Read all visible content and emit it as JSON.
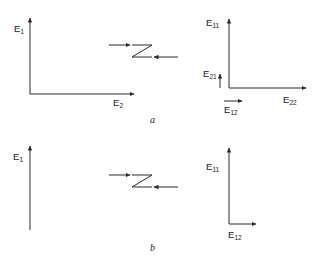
{
  "figure": {
    "stroke_color": "#2b2b2b",
    "background_color": "#ffffff"
  },
  "panels": [
    {
      "id": "a",
      "letter": "a",
      "left_axes": {
        "name": "incident-field-axes",
        "vertical": {
          "label": "E",
          "sub": "1",
          "arrow": "up"
        },
        "horizontal": {
          "label": "E",
          "sub": "2",
          "arrow": "right"
        }
      },
      "network": {
        "symbol": "Z",
        "in_arrow": {
          "direction": "right",
          "position": "top-left"
        },
        "out_arrow": {
          "direction": "left",
          "position": "bottom-right"
        }
      },
      "right_axes": {
        "name": "scattered-field-axes",
        "vertical": {
          "label": "E",
          "sub": "11",
          "arrow": "up"
        },
        "horizontal": {
          "label": "E",
          "sub": "22",
          "arrow": "right"
        },
        "minor_vertical": {
          "label": "E",
          "sub": "21",
          "arrow": "up"
        },
        "minor_horizontal": {
          "label": "E",
          "sub": "12",
          "arrow": "right"
        }
      }
    },
    {
      "id": "b",
      "letter": "b",
      "left_axes": {
        "name": "incident-field-axes",
        "vertical": {
          "label": "E",
          "sub": "1",
          "arrow": "up"
        },
        "horizontal": null
      },
      "network": {
        "symbol": "Z",
        "in_arrow": {
          "direction": "right",
          "position": "top-left"
        },
        "out_arrow": {
          "direction": "right",
          "position": "bottom-right"
        }
      },
      "right_axes": {
        "name": "scattered-field-axes",
        "vertical": {
          "label": "E",
          "sub": "11",
          "arrow": "up"
        },
        "horizontal": {
          "label": "E",
          "sub": "12",
          "arrow": "right"
        }
      }
    }
  ],
  "labels": {
    "a_E1": "E",
    "a_E1_sub": "1",
    "a_E2": "E",
    "a_E2_sub": "2",
    "a_E11": "E",
    "a_E11_sub": "11",
    "a_E22": "E",
    "a_E22_sub": "22",
    "a_E21": "E",
    "a_E21_sub": "21",
    "a_E12": "E",
    "a_E12_sub": "12",
    "a_letter": "a",
    "b_E1": "E",
    "b_E1_sub": "1",
    "b_E11": "E",
    "b_E11_sub": "11",
    "b_E12": "E",
    "b_E12_sub": "12",
    "b_letter": "b"
  }
}
